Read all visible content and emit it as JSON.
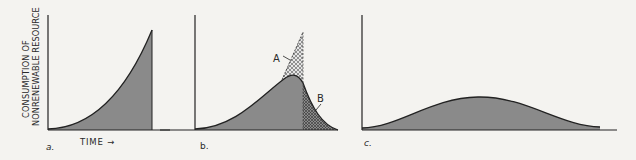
{
  "figure": {
    "y_axis_label_line1": "CONSUMPTION OF",
    "y_axis_label_line2": "NONRENEWABLE RESOURCE",
    "x_axis_label": "TIME →",
    "panels": [
      {
        "id": "a",
        "label": "a.",
        "description": "Exponential growth in consumption, abruptly stopping when resource is exhausted"
      },
      {
        "id": "b",
        "label": "b.",
        "description": "Consumption rises then declines; shaded areas A and B compare consumption paths",
        "annotations": [
          "A",
          "B"
        ]
      },
      {
        "id": "c",
        "label": "c.",
        "description": "Gradual bell-shaped consumption curve, spread over a longer time"
      }
    ],
    "colors": {
      "fill": "#8a8a8a",
      "line": "#222222",
      "background": "#f4f3f0"
    }
  }
}
